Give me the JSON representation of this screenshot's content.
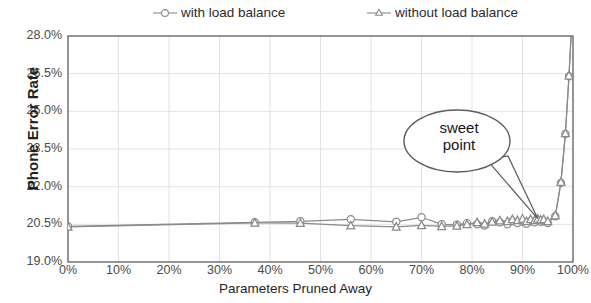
{
  "chart_data": {
    "type": "line",
    "title": "",
    "subtitle": "",
    "xlabel": "Parameters Pruned Away",
    "ylabel": "Phone Error Rate",
    "xlim": [
      0,
      100
    ],
    "ylim": [
      19.0,
      28.0
    ],
    "xticks": [
      "0%",
      "10%",
      "20%",
      "30%",
      "40%",
      "50%",
      "60%",
      "70%",
      "80%",
      "90%",
      "100%"
    ],
    "xtick_values": [
      0,
      10,
      20,
      30,
      40,
      50,
      60,
      70,
      80,
      90,
      100
    ],
    "yticks": [
      "19.0%",
      "20.5%",
      "22.0%",
      "23.5%",
      "25.0%",
      "26.5%",
      "28.0%"
    ],
    "ytick_values": [
      19.0,
      20.5,
      22.0,
      23.5,
      25.0,
      26.5,
      28.0
    ],
    "grid": true,
    "grid_color": "#e2e2e2",
    "legend_position": "top",
    "line_color": "#8a8a8a",
    "series": [
      {
        "name": "with load balance",
        "marker": "circle",
        "color": "#8a8a8a",
        "x": [
          0,
          37,
          46,
          56,
          65,
          70,
          74,
          77,
          79,
          81,
          82.5,
          84,
          85.5,
          87,
          88,
          89,
          90,
          90.8,
          91.6,
          92.4,
          93,
          93.6,
          94.2,
          95,
          96.5,
          97.6,
          98.5,
          99.2,
          100
        ],
        "y": [
          20.42,
          20.58,
          20.62,
          20.7,
          20.6,
          20.78,
          20.5,
          20.48,
          20.55,
          20.5,
          20.45,
          20.62,
          20.58,
          20.5,
          20.62,
          20.55,
          20.6,
          20.52,
          20.62,
          20.58,
          20.66,
          20.6,
          20.62,
          20.55,
          20.82,
          22.15,
          24.1,
          26.4,
          29.5
        ]
      },
      {
        "name": "without load balance",
        "marker": "triangle",
        "color": "#8a8a8a",
        "x": [
          0,
          37,
          46,
          56,
          65,
          70,
          74,
          77,
          79,
          81,
          82.5,
          84,
          85.5,
          87,
          88,
          89,
          90,
          90.8,
          91.6,
          92.4,
          93,
          93.6,
          94.2,
          95,
          96.5,
          97.6,
          98.5,
          99.2,
          100
        ],
        "y": [
          20.4,
          20.56,
          20.55,
          20.45,
          20.4,
          20.46,
          20.42,
          20.44,
          20.5,
          20.58,
          20.52,
          20.6,
          20.65,
          20.62,
          20.7,
          20.66,
          20.72,
          20.62,
          20.7,
          20.66,
          20.72,
          20.68,
          20.7,
          20.62,
          20.85,
          22.18,
          24.12,
          26.42,
          29.5
        ]
      }
    ],
    "annotations": [
      {
        "text": "sweet point",
        "line1": "sweet",
        "line2": "point",
        "shape": "speech-ellipse",
        "target_x": 93,
        "target_y": 20.65
      }
    ]
  },
  "legend": {
    "items": [
      {
        "label": "with load balance",
        "marker": "circle"
      },
      {
        "label": "without load balance",
        "marker": "triangle"
      }
    ]
  },
  "axes": {
    "y_title": "Phone Error Rate",
    "x_title": "Parameters Pruned Away"
  }
}
